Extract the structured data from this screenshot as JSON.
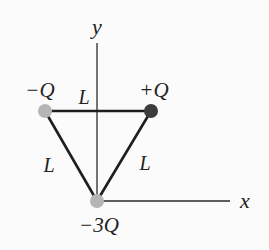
{
  "diagram": {
    "type": "charge-triangle",
    "axes": {
      "x_label": "x",
      "y_label": "y"
    },
    "side_length_label": "L",
    "sides": [
      {
        "label": "L",
        "between": [
          "-Q",
          "+Q"
        ]
      },
      {
        "label": "L",
        "between": [
          "-Q",
          "-3Q"
        ]
      },
      {
        "label": "L",
        "between": [
          "+Q",
          "-3Q"
        ]
      }
    ],
    "charges": [
      {
        "label": "−Q",
        "position": "top-left",
        "color": "#b5b5b5"
      },
      {
        "label": "+Q",
        "position": "top-right",
        "color": "#3c3c3c"
      },
      {
        "label": "−3Q",
        "position": "origin",
        "color": "#b5b5b5"
      }
    ],
    "colors": {
      "line": "#1e1e1e",
      "axis": "#2a2a2a",
      "negative_charge": "#b5b5b5",
      "positive_charge": "#3c3c3c",
      "background": "#fbfbfb"
    }
  }
}
